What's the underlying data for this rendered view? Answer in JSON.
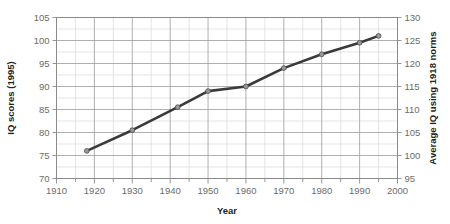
{
  "chart_data": {
    "type": "line",
    "title": "",
    "xlabel": "Year",
    "ylabel": "IQ scores (1995)",
    "y2label": "Average IQ using 1918 norms",
    "x": [
      1918,
      1930,
      1942,
      1950,
      1960,
      1970,
      1980,
      1990,
      1995
    ],
    "values": [
      76,
      80.5,
      85.5,
      89,
      90,
      94,
      97,
      99.5,
      101
    ],
    "series": [
      {
        "name": "IQ scores (1995 norms)",
        "values": [
          76,
          80.5,
          85.5,
          89,
          90,
          94,
          97,
          99.5,
          101
        ]
      }
    ],
    "xlim": [
      1910,
      2000
    ],
    "ylim": [
      70,
      105
    ],
    "y2lim": [
      95,
      130
    ],
    "xticks": [
      1910,
      1920,
      1930,
      1940,
      1950,
      1960,
      1970,
      1980,
      1990,
      2000
    ],
    "xtick_labels": [
      "1910",
      "1920",
      "1930",
      "1940",
      "1950",
      "1960",
      "1970",
      "1980",
      "1990",
      "2000"
    ],
    "yticks": [
      70,
      75,
      80,
      85,
      90,
      95,
      100,
      105
    ],
    "ytick_labels": [
      "70",
      "75",
      "80",
      "85",
      "90",
      "95",
      "100",
      "105"
    ],
    "y2ticks": [
      95,
      100,
      105,
      110,
      115,
      120,
      125,
      130
    ],
    "y2tick_labels": [
      "95",
      "100",
      "105",
      "110",
      "115",
      "120",
      "125",
      "130"
    ],
    "grid": true,
    "minor_grid": true,
    "legend": "none",
    "line_color": "#3a3a3a",
    "marker_color": "#9a9a9a",
    "grid_color": "#d8d8d8",
    "major_grid_color": "#9c9c9c",
    "axis_color": "#8a8a8a",
    "text_color": "#6b6b6b",
    "title_color": "#231f20"
  }
}
